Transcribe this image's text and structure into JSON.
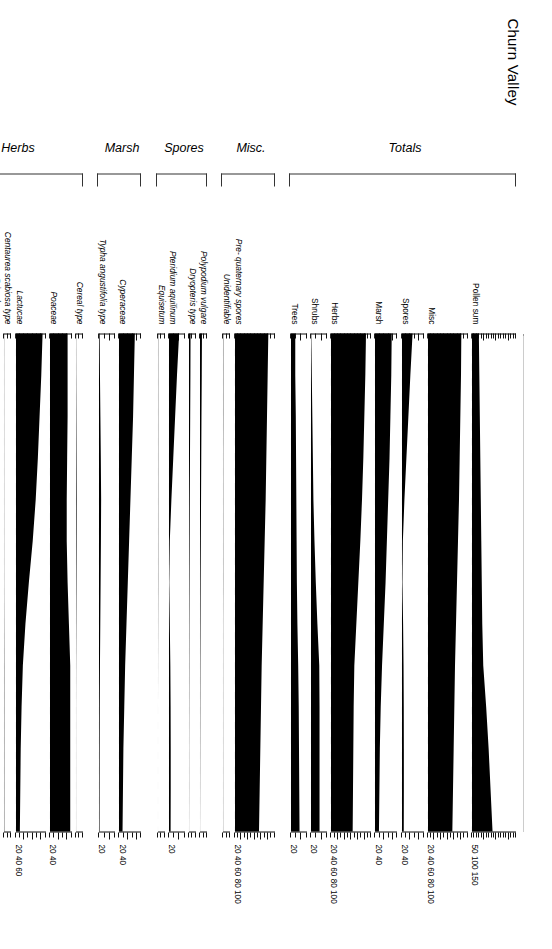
{
  "title": "Churn Valley",
  "axes": {
    "depth_label": "Depth cm",
    "depth_ticks": [
      20,
      25,
      30,
      35,
      40,
      45,
      50,
      55,
      60,
      65,
      70,
      75,
      80
    ],
    "depth_min": 20,
    "depth_max": 80,
    "depth_unit": "cm"
  },
  "groups": [
    {
      "name": "Trees/Shrubs",
      "label": "Trees/Shrubs"
    },
    {
      "name": "Herbs",
      "label": "Herbs"
    },
    {
      "name": "Marsh",
      "label": "Marsh"
    },
    {
      "name": "Spores",
      "label": "Spores"
    },
    {
      "name": "Misc.",
      "label": "Misc."
    },
    {
      "name": "Totals",
      "label": "Totals"
    }
  ],
  "chart_data": {
    "type": "area",
    "title": "Churn Valley",
    "xlabel": "Depth cm",
    "ylabel": "",
    "x": [
      20,
      25,
      30,
      35,
      40,
      45,
      50,
      55,
      60,
      65,
      70,
      75,
      80
    ],
    "xlim": [
      20,
      80
    ],
    "grid": false,
    "legend": "none",
    "orientation": "horizontal-depth-axis",
    "series": [
      {
        "name": "Pinus",
        "group": "Trees/Shrubs",
        "scale_max": 10,
        "scale_ticks": [],
        "scale_label": "",
        "values": [
          0.4,
          1.0,
          2.0,
          2.6,
          3.0,
          2.4,
          1.6,
          1.0,
          0.5,
          0.2,
          0.1,
          0.1,
          0.1
        ]
      },
      {
        "name": "Ulmus",
        "group": "Trees/Shrubs",
        "scale_max": 10,
        "scale_ticks": [],
        "scale_label": "",
        "values": [
          0.1,
          0.1,
          0.2,
          0.3,
          0.5,
          0.8,
          1.1,
          1.2,
          1.2,
          1.0,
          0.8,
          0.5,
          0.2
        ]
      },
      {
        "name": "Quercus",
        "group": "Trees/Shrubs",
        "scale_max": 30,
        "scale_ticks": [
          20
        ],
        "scale_label": "20",
        "values": [
          7,
          7,
          6.5,
          6,
          5.5,
          6.5,
          8,
          10,
          12.5,
          14,
          15,
          15.5,
          16
        ]
      },
      {
        "name": "Tilia",
        "group": "Trees/Shrubs",
        "scale_max": 10,
        "scale_ticks": [],
        "scale_label": "",
        "values": [
          0,
          0,
          0,
          0,
          0,
          0,
          0,
          0,
          0,
          0.1,
          0.3,
          0.6,
          0.9
        ]
      },
      {
        "name": "Fraxinus",
        "group": "Trees/Shrubs",
        "scale_max": 10,
        "scale_ticks": [],
        "scale_label": "",
        "values": [
          0,
          0,
          0,
          0,
          0,
          0,
          0,
          0,
          0.1,
          0.2,
          0.4,
          0.7,
          1.0
        ]
      },
      {
        "name": "Corylus avellana type",
        "group": "Trees/Shrubs",
        "scale_max": 30,
        "scale_ticks": [
          20
        ],
        "scale_label": "20",
        "values": [
          0.5,
          1.5,
          2.5,
          3.5,
          4.5,
          6.5,
          9,
          12,
          15.5,
          16,
          16,
          16,
          16
        ]
      },
      {
        "name": "Ranunculus type",
        "group": "Herbs",
        "scale_max": 10,
        "scale_ticks": [],
        "scale_label": "",
        "values": [
          0.1,
          0.1,
          0.1,
          0.1,
          0.1,
          0.1,
          0.1,
          0.1,
          0.1,
          0.1,
          0.1,
          0.1,
          0.1
        ]
      },
      {
        "name": "Dianthus type",
        "group": "Herbs",
        "scale_max": 10,
        "scale_ticks": [],
        "scale_label": "",
        "values": [
          0.8,
          0.8,
          0.7,
          0.7,
          0.6,
          0.5,
          0.4,
          0.3,
          0.3,
          0.2,
          0.2,
          0.2,
          0.2
        ]
      },
      {
        "name": "Sinapis type",
        "group": "Herbs",
        "scale_max": 10,
        "scale_ticks": [],
        "scale_label": "",
        "values": [
          0.3,
          0.3,
          0.3,
          0.3,
          0.3,
          0.2,
          0.2,
          0.2,
          0.2,
          0.2,
          0.2,
          0.2,
          0.2
        ]
      },
      {
        "name": "Chenopodium type",
        "group": "Herbs",
        "scale_max": 10,
        "scale_ticks": [],
        "scale_label": "",
        "values": [
          0.5,
          0.5,
          0.4,
          0.4,
          0.4,
          0.3,
          0.3,
          0.3,
          0.2,
          0.2,
          0.2,
          0.2,
          0.2
        ]
      },
      {
        "name": "Primulaceae",
        "group": "Herbs",
        "scale_max": 10,
        "scale_ticks": [],
        "scale_label": "",
        "values": [
          0.9,
          0.9,
          0.9,
          0.8,
          0.8,
          0.7,
          0.6,
          0.6,
          0.5,
          0.4,
          0.4,
          0.3,
          0.3
        ]
      },
      {
        "name": "Centaurea scabiosa type",
        "group": "Herbs",
        "scale_max": 10,
        "scale_ticks": [],
        "scale_label": "",
        "values": [
          0.2,
          0.2,
          0.2,
          0.2,
          0.2,
          0.2,
          0.2,
          0.3,
          0.4,
          0.4,
          0.4,
          0.4,
          0.4
        ]
      },
      {
        "name": "Lactucae",
        "group": "Herbs",
        "scale_max": 70,
        "scale_ticks": [
          20,
          40,
          60
        ],
        "scale_label": "20 40 60",
        "values": [
          62,
          59,
          55,
          51,
          46,
          39,
          30,
          22,
          16,
          13,
          11,
          10,
          9
        ]
      },
      {
        "name": "Poaceae",
        "group": "Herbs",
        "scale_max": 50,
        "scale_ticks": [
          20,
          40
        ],
        "scale_label": "20 40",
        "values": [
          40,
          40,
          40,
          39,
          38,
          38,
          40,
          43,
          46,
          46,
          46,
          46,
          46
        ]
      },
      {
        "name": "Cereal type",
        "group": "Herbs",
        "scale_max": 10,
        "scale_ticks": [],
        "scale_label": "",
        "values": [
          0.2,
          0.3,
          0.5,
          0.7,
          0.9,
          0.8,
          0.6,
          0.4,
          0.2,
          0.1,
          0.1,
          0.1,
          0.1
        ]
      },
      {
        "name": "Typha angustifolia type",
        "group": "Marsh",
        "scale_max": 30,
        "scale_ticks": [
          20
        ],
        "scale_label": "20",
        "values": [
          1.2,
          1.8,
          2.6,
          3.4,
          4.0,
          3.6,
          3.0,
          2.4,
          1.8,
          1.4,
          1.2,
          1.1,
          1.0
        ]
      },
      {
        "name": "Cyperaceae",
        "group": "Marsh",
        "scale_max": 50,
        "scale_ticks": [
          20,
          40
        ],
        "scale_label": "20 40",
        "values": [
          36,
          34,
          32,
          29,
          26,
          23,
          20,
          17,
          14,
          12,
          10,
          9,
          8
        ]
      },
      {
        "name": "Equisetum",
        "group": "Spores",
        "scale_max": 10,
        "scale_ticks": [],
        "scale_label": "",
        "values": [
          0.3,
          0.3,
          0.3,
          0.3,
          0.3,
          0.3,
          0.3,
          0.2,
          0.1,
          0,
          0,
          0,
          0
        ]
      },
      {
        "name": "Pteridium aquilinum",
        "group": "Spores",
        "scale_max": 30,
        "scale_ticks": [
          20
        ],
        "scale_label": "20",
        "values": [
          19,
          15,
          11.5,
          8,
          4.5,
          1.5,
          0.5,
          1.5,
          2.5,
          3.0,
          3.2,
          3.2,
          3.0
        ]
      },
      {
        "name": "Dryopteris type",
        "group": "Spores",
        "scale_max": 10,
        "scale_ticks": [],
        "scale_label": "",
        "values": [
          2.2,
          2.0,
          1.7,
          1.4,
          1.1,
          0.9,
          0.7,
          0.5,
          0.4,
          0.3,
          0.2,
          0.2,
          0.1
        ]
      },
      {
        "name": "Polypodium vulgare",
        "group": "Spores",
        "scale_max": 10,
        "scale_ticks": [],
        "scale_label": "",
        "values": [
          2.8,
          2.5,
          2.1,
          1.8,
          1.5,
          1.2,
          0.9,
          0.7,
          0.5,
          0.4,
          0.3,
          0.2,
          0.1
        ]
      },
      {
        "name": "Unidentifiable",
        "group": "Misc.",
        "scale_max": 10,
        "scale_ticks": [],
        "scale_label": "",
        "values": [
          0.4,
          0.4,
          0.4,
          0.3,
          0.3,
          0.3,
          0.3,
          0.2,
          0.2,
          0.2,
          0.2,
          0.2,
          0.2
        ]
      },
      {
        "name": "Pre- quaternary spores",
        "group": "Misc.",
        "scale_max": 120,
        "scale_ticks": [
          20,
          40,
          60,
          80,
          100
        ],
        "scale_label": "20 40 60 80 100",
        "values": [
          100,
          98,
          96,
          94,
          92,
          89,
          86,
          83,
          80,
          78,
          76,
          74,
          72
        ]
      },
      {
        "name": "Trees",
        "group": "Totals",
        "scale_max": 30,
        "scale_ticks": [
          20
        ],
        "scale_label": "20",
        "values": [
          8,
          8,
          9,
          9.5,
          10,
          10.5,
          11,
          12,
          13.5,
          14.5,
          15,
          15.5,
          16
        ]
      },
      {
        "name": "Shrubs",
        "group": "Totals",
        "scale_max": 30,
        "scale_ticks": [
          20
        ],
        "scale_label": "20",
        "values": [
          0.5,
          1.5,
          2.5,
          3.5,
          4.5,
          6.5,
          9,
          12,
          15.5,
          16,
          16,
          16,
          16
        ]
      },
      {
        "name": "Herbs",
        "group": "Totals",
        "scale_max": 120,
        "scale_ticks": [
          20,
          40,
          60,
          80,
          100
        ],
        "scale_label": "20 40 60 80 100",
        "values": [
          105,
          103,
          100,
          97,
          93,
          88,
          82,
          76,
          70,
          68,
          67,
          66,
          65
        ]
      },
      {
        "name": "Marsh",
        "group": "Totals",
        "scale_max": 50,
        "scale_ticks": [
          20,
          40
        ],
        "scale_label": "20 40",
        "values": [
          38,
          37,
          35,
          33,
          30,
          27,
          24,
          20,
          16,
          13,
          11,
          10,
          9
        ]
      },
      {
        "name": "Spores",
        "group": "Totals",
        "scale_max": 50,
        "scale_ticks": [
          20,
          40
        ],
        "scale_label": "20 40",
        "values": [
          24,
          19,
          14.5,
          10,
          5.5,
          2.0,
          1.0,
          2.5,
          3.5,
          4.0,
          4.2,
          4.2,
          4.0
        ]
      },
      {
        "name": "Misc",
        "group": "Totals",
        "scale_max": 120,
        "scale_ticks": [
          20,
          40,
          60,
          80,
          100
        ],
        "scale_label": "20 40 60 80 100",
        "values": [
          100,
          99,
          97,
          95,
          93,
          90,
          87,
          84,
          81,
          79,
          77,
          75,
          73
        ]
      },
      {
        "name": "Pollen sum",
        "group": "Totals",
        "scale_max": 180,
        "scale_ticks": [
          50,
          100,
          150
        ],
        "scale_label": "50 100 150",
        "values": [
          28,
          30,
          32,
          34,
          36,
          38,
          40,
          42,
          46,
          58,
          68,
          76,
          84
        ]
      }
    ]
  }
}
